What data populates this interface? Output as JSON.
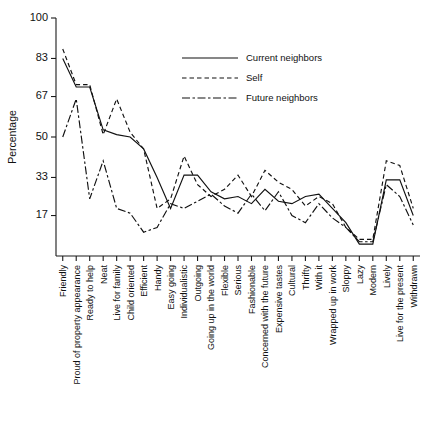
{
  "chart_data": {
    "type": "line",
    "title": "",
    "xlabel": "",
    "ylabel": "Percentage",
    "ylim": [
      0,
      100
    ],
    "yticks": [
      17,
      33,
      50,
      67,
      83,
      100
    ],
    "grid": false,
    "legend_position": "top-right",
    "categories": [
      "Friendly",
      "Proud of property appearance",
      "Ready to help",
      "Neat",
      "Live for family",
      "Child oriented",
      "Efficient",
      "Handy",
      "Easy going",
      "Individualistic",
      "Outgoing",
      "Going up in the world",
      "Flexible",
      "Serious",
      "Fashionable",
      "Concerned with the future",
      "Expensive tastes",
      "Cultural",
      "Thrifty",
      "With it",
      "Wrapped up in work",
      "Sloppy",
      "Lazy",
      "Modern",
      "Lively",
      "Live for the present",
      "Withdrawn"
    ],
    "series": [
      {
        "name": "Current neighbors",
        "style": "solid",
        "values": [
          83,
          71,
          71,
          53,
          51,
          50,
          45,
          33,
          20,
          34,
          34,
          27,
          24,
          25,
          22,
          28,
          23,
          22,
          25,
          26,
          20,
          14,
          5,
          5,
          32,
          32,
          17
        ]
      },
      {
        "name": "Self",
        "style": "dashed",
        "values": [
          87,
          72,
          72,
          51,
          66,
          52,
          45,
          20,
          24,
          42,
          30,
          25,
          28,
          34,
          25,
          36,
          31,
          28,
          21,
          25,
          22,
          12,
          7,
          7,
          40,
          38,
          20
        ]
      },
      {
        "name": "Future neighbors",
        "style": "dash-dot",
        "values": [
          50,
          66,
          24,
          40,
          20,
          18,
          10,
          12,
          22,
          20,
          23,
          26,
          21,
          18,
          26,
          19,
          27,
          17,
          14,
          22,
          16,
          12,
          6,
          6,
          30,
          25,
          13
        ]
      }
    ]
  },
  "legend": {
    "items": [
      {
        "label": "Current neighbors",
        "style": "solid"
      },
      {
        "label": "Self",
        "style": "dashed"
      },
      {
        "label": "Future neighbors",
        "style": "dash-dot"
      }
    ]
  },
  "colors": {
    "ink": "#111111",
    "background": "#ffffff"
  }
}
